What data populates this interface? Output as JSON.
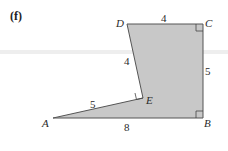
{
  "part_label": "(f)",
  "vertices": {
    "A": {
      "label": "A",
      "x": 53,
      "y": 118
    },
    "B": {
      "label": "B",
      "x": 203,
      "y": 118
    },
    "C": {
      "label": "C",
      "x": 203,
      "y": 24
    },
    "D": {
      "label": "D",
      "x": 127,
      "y": 24
    },
    "E": {
      "label": "E",
      "x": 143,
      "y": 98
    }
  },
  "side_lengths": {
    "DC": "4",
    "CB": "5",
    "DE": "4",
    "AE": "5",
    "AB": "8"
  },
  "right_angles": [
    "C",
    "B",
    "E"
  ],
  "colors": {
    "fill": "#c8c8c8",
    "stroke": "#555555",
    "band": "#d9d9d9"
  }
}
